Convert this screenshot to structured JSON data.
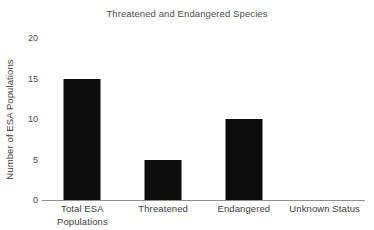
{
  "chart_data": {
    "type": "bar",
    "title": "Threatened and Endangered Species",
    "xlabel": "",
    "ylabel": "Number of ESA Populations",
    "categories": [
      "Total ESA Populations",
      "Threatened",
      "Endangered",
      "Unknown Status"
    ],
    "category_lines": [
      [
        "Total ESA",
        "Populations"
      ],
      [
        "Threatened"
      ],
      [
        "Endangered"
      ],
      [
        "Unknown Status"
      ]
    ],
    "values": [
      15,
      5,
      10,
      0
    ],
    "ylim": [
      0,
      20
    ],
    "yticks": [
      0,
      5,
      10,
      15,
      20
    ],
    "ytick_labels": [
      "0",
      "5",
      "10",
      "15",
      "20"
    ],
    "grid": false,
    "legend": false,
    "bar_color": "#0d0d0d",
    "axis_color": "#8f8f8f",
    "title_color": "#4d4d4d",
    "label_color": "#3d3d3d"
  }
}
